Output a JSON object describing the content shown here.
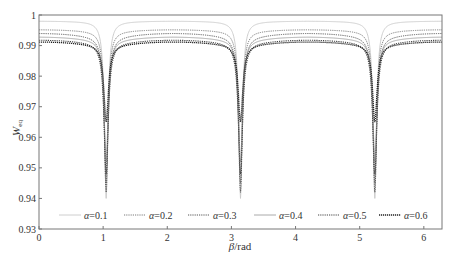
{
  "chart_data": {
    "type": "line",
    "title": "",
    "xlabel": "β/rad",
    "ylabel": "W_eq",
    "xlim": [
      0,
      6.2832
    ],
    "ylim": [
      0.93,
      1.0
    ],
    "xticks": [
      0,
      1,
      2,
      3,
      4,
      5,
      6
    ],
    "yticks": [
      0.93,
      0.94,
      0.95,
      0.96,
      0.97,
      0.98,
      0.99,
      1
    ],
    "ytick_labels": [
      "0.93",
      "0.94",
      "0.95",
      "0.96",
      "0.97",
      "0.98",
      "0.99",
      "1"
    ],
    "grid": false,
    "legend_position": "bottom-inside, single row",
    "dip_locations": [
      1.047,
      3.1416,
      5.236
    ],
    "series": [
      {
        "name": "α=0.1",
        "plateau": 0.998,
        "edge": 0.9978,
        "minimum": 0.94,
        "color": "#c8c8c8",
        "dash": "",
        "width": 0.9
      },
      {
        "name": "α=0.2",
        "plateau": 0.9952,
        "edge": 0.9945,
        "minimum": 0.945,
        "color": "#7a7a7a",
        "dash": "1.2,1",
        "width": 1.0
      },
      {
        "name": "α=0.3",
        "plateau": 0.994,
        "edge": 0.9925,
        "minimum": 0.942,
        "color": "#555555",
        "dash": "1.2,1",
        "width": 1.0
      },
      {
        "name": "α=0.4",
        "plateau": 0.9928,
        "edge": 0.9915,
        "minimum": 0.952,
        "color": "#a0a0a0",
        "dash": "",
        "width": 0.9
      },
      {
        "name": "α=0.5",
        "plateau": 0.9918,
        "edge": 0.9905,
        "minimum": 0.948,
        "color": "#444444",
        "dash": "1.2,1",
        "width": 1.1
      },
      {
        "name": "α=0.6",
        "plateau": 0.9912,
        "edge": 0.9898,
        "minimum": 0.965,
        "color": "#222222",
        "dash": "1.2,0.8",
        "width": 1.3
      }
    ]
  },
  "legend": {
    "items": [
      "α=0.1",
      "α=0.2",
      "α=0.3",
      "α=0.4",
      "α=0.5",
      "α=0.6"
    ]
  },
  "axes": {
    "x_label_greek": "β",
    "x_label_unit": "/rad",
    "y_label_main": "W",
    "y_label_sub": "eq"
  }
}
